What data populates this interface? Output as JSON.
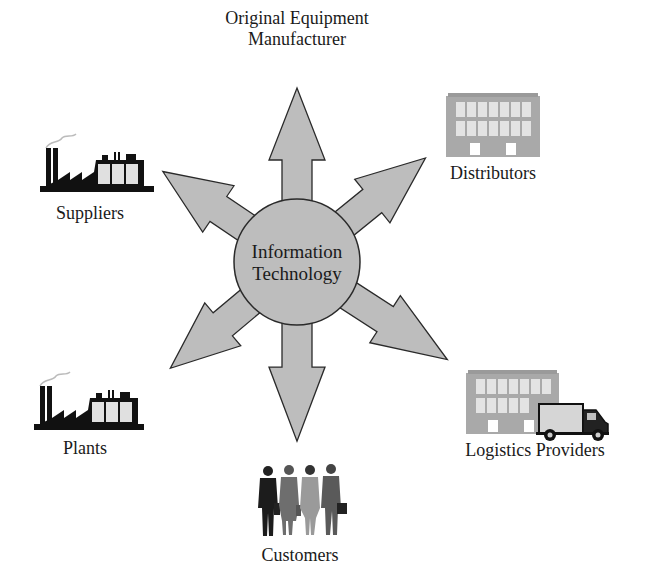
{
  "diagram": {
    "center": {
      "line1": "Information",
      "line2": "Technology"
    },
    "nodes": {
      "oem": {
        "line1": "Original Equipment",
        "line2": "Manufacturer",
        "icon": "none"
      },
      "distributors": {
        "label": "Distributors",
        "icon": "building-icon"
      },
      "logistics": {
        "label": "Logistics Providers",
        "icon": "building-truck-icon"
      },
      "customers": {
        "label": "Customers",
        "icon": "business-people-icon"
      },
      "plants": {
        "label": "Plants",
        "icon": "factory-icon"
      },
      "suppliers": {
        "label": "Suppliers",
        "icon": "factory-icon"
      }
    },
    "colors": {
      "fill": "#bdbdbd",
      "stroke": "#2a2a2a",
      "building": "#a9a9a9",
      "window": "#e6e6e6",
      "factory": "#111111"
    }
  }
}
